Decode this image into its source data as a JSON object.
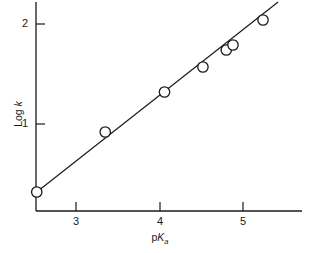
{
  "chart_data": {
    "type": "scatter",
    "title": "",
    "subtitle": "",
    "xlabel": "pKa",
    "xlabel_parts": {
      "prefix": "p",
      "italic": "K",
      "subscript": "a"
    },
    "ylabel": "Log k",
    "ylabel_parts": {
      "prefix": "Log ",
      "italic": "k"
    },
    "x": [
      2.53,
      3.35,
      4.06,
      4.52,
      4.8,
      4.88,
      5.24
    ],
    "y": [
      0.32,
      0.92,
      1.32,
      1.57,
      1.74,
      1.79,
      2.04
    ],
    "points": [
      {
        "x": 2.53,
        "y": 0.32
      },
      {
        "x": 3.35,
        "y": 0.92
      },
      {
        "x": 4.06,
        "y": 1.32
      },
      {
        "x": 4.52,
        "y": 1.57
      },
      {
        "x": 4.8,
        "y": 1.74
      },
      {
        "x": 4.88,
        "y": 1.79
      },
      {
        "x": 5.24,
        "y": 2.04
      }
    ],
    "fit_line": {
      "type": "line",
      "x_start": 2.53,
      "y_start": 0.32,
      "x_end": 5.42,
      "y_end": 2.22,
      "slope": 0.66,
      "intercept": -1.34
    },
    "xlim": [
      2.37,
      5.7
    ],
    "ylim": [
      0.08,
      2.24
    ],
    "xticks": [
      3,
      4,
      5
    ],
    "xtick_labels": [
      "3",
      "4",
      "5"
    ],
    "yticks": [
      1,
      2
    ],
    "ytick_labels": [
      "1",
      "2"
    ],
    "grid": false,
    "legend": null,
    "marker": "open-circle",
    "marker_color": "#1a1a1a",
    "line_color": "#1a1a1a",
    "axis_color": "#1a1a1a",
    "background": "#ffffff"
  }
}
